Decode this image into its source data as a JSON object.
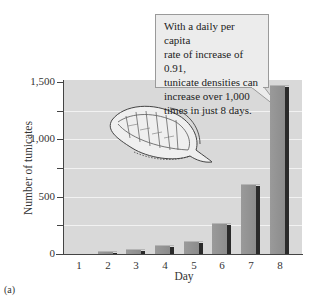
{
  "chart_data": {
    "type": "bar",
    "title": "",
    "xlabel": "Day",
    "ylabel": "Number of tunicates",
    "categories": [
      "1",
      "2",
      "3",
      "4",
      "5",
      "6",
      "7",
      "8"
    ],
    "values": [
      10,
      20,
      35,
      70,
      105,
      260,
      600,
      1465
    ],
    "ylim": [
      0,
      1500
    ],
    "yticks": [
      0,
      250,
      500,
      750,
      1000,
      1250,
      1500
    ],
    "ytick_labels": [
      "0",
      "",
      "500",
      "",
      "1,000",
      "",
      "1,500"
    ],
    "grid": true,
    "legend": null,
    "annotation": "With a daily per capita rate of increase of 0.91, tunicate densities can increase over 1,000 times in just 8 days."
  },
  "figure_label": "(a)",
  "axis": {
    "y_title": "Number of tunicates",
    "x_title": "Day",
    "y_labels": [
      {
        "value": 1500,
        "text": "1,500"
      },
      {
        "value": 1000,
        "text": "1,000"
      },
      {
        "value": 500,
        "text": "500"
      },
      {
        "value": 0,
        "text": "0"
      }
    ],
    "x_labels": [
      "1",
      "2",
      "3",
      "4",
      "5",
      "6",
      "7",
      "8"
    ]
  },
  "callout": {
    "lines": [
      "With a daily per capita",
      "rate of increase of 0.91,",
      "tunicate densities can",
      "increase over 1,000",
      "times in just 8 days."
    ]
  },
  "colors": {
    "plot_background": "#d9d9d9",
    "gridline": "#f2f2f2",
    "bar": "#949494",
    "bar_shadow": "#2a2a2a",
    "callout_background": "#ececec"
  }
}
